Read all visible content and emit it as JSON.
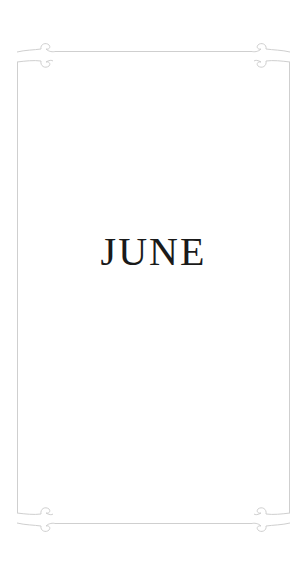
{
  "card": {
    "title": "JUNE",
    "frame_color": "#cfcfcf",
    "background": "#ffffff",
    "ornaments": [
      "corner-flourish-top-left",
      "corner-flourish-top-right",
      "corner-flourish-bottom-left",
      "corner-flourish-bottom-right"
    ]
  }
}
